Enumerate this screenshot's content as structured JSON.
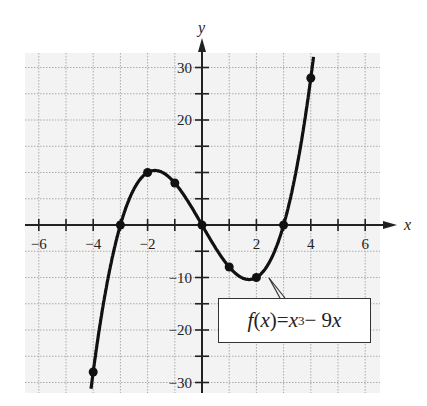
{
  "chart_data": {
    "type": "line",
    "title": "",
    "function_label": {
      "f": "f",
      "x": "x",
      "eq": " = ",
      "exp": "3",
      "rest": " − 9"
    },
    "xlabel": "x",
    "ylabel": "y",
    "xlim": [
      -6.5,
      6.5
    ],
    "ylim": [
      -32,
      33
    ],
    "x_ticks": [
      -6,
      -4,
      -2,
      2,
      4,
      6
    ],
    "x_tick_labels": [
      "−6",
      "−4",
      "−2",
      "2",
      "4",
      "6"
    ],
    "y_ticks": [
      30,
      20,
      -10,
      -20,
      -30
    ],
    "y_tick_labels": [
      "30",
      "20",
      "−10",
      "−20",
      "−30"
    ],
    "grid": true,
    "series": [
      {
        "name": "f(x) = x^3 - 9x",
        "points": [
          {
            "x": -4,
            "y": -28
          },
          {
            "x": -3,
            "y": 0
          },
          {
            "x": -2,
            "y": 10
          },
          {
            "x": -1,
            "y": 8
          },
          {
            "x": 0,
            "y": 0
          },
          {
            "x": 1,
            "y": -8
          },
          {
            "x": 2,
            "y": -10
          },
          {
            "x": 3,
            "y": 0
          },
          {
            "x": 4,
            "y": 28
          }
        ]
      }
    ]
  }
}
